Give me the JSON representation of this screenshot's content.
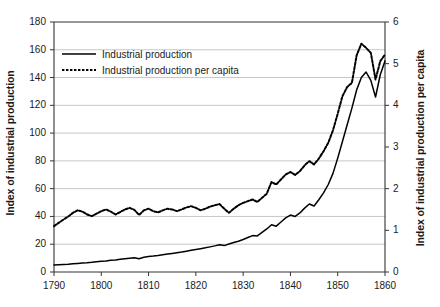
{
  "chart_data": {
    "type": "line",
    "title": "",
    "xlabel": "",
    "ylabel": "Index of industrial production",
    "y2label": "Index of industrial production per capita",
    "xlim": [
      1790,
      1860
    ],
    "ylim": [
      0,
      180
    ],
    "y2lim": [
      0,
      6
    ],
    "xticks": [
      "1790",
      "1800",
      "1810",
      "1820",
      "1830",
      "1840",
      "1850",
      "1860"
    ],
    "yticks": [
      "0",
      "20",
      "40",
      "60",
      "80",
      "100",
      "120",
      "140",
      "160",
      "180"
    ],
    "y2ticks": [
      "0",
      "1",
      "2",
      "3",
      "4",
      "5",
      "6"
    ],
    "grid": "horizontal",
    "legend_position": "upper-left-inside",
    "legend": [
      {
        "label": "Industrial production",
        "style": "solid",
        "axis": "left",
        "color": "#000000"
      },
      {
        "label": "Industrial production per capita",
        "style": "dotted",
        "axis": "right",
        "color": "#000000"
      }
    ],
    "x": [
      1790,
      1791,
      1792,
      1793,
      1794,
      1795,
      1796,
      1797,
      1798,
      1799,
      1800,
      1801,
      1802,
      1803,
      1804,
      1805,
      1806,
      1807,
      1808,
      1809,
      1810,
      1811,
      1812,
      1813,
      1814,
      1815,
      1816,
      1817,
      1818,
      1819,
      1820,
      1821,
      1822,
      1823,
      1824,
      1825,
      1826,
      1827,
      1828,
      1829,
      1830,
      1831,
      1832,
      1833,
      1834,
      1835,
      1836,
      1837,
      1838,
      1839,
      1840,
      1841,
      1842,
      1843,
      1844,
      1845,
      1846,
      1847,
      1848,
      1849,
      1850,
      1851,
      1852,
      1853,
      1854,
      1855,
      1856,
      1857,
      1858,
      1859,
      1860
    ],
    "series": [
      {
        "name": "Industrial production",
        "axis": "left",
        "style": "solid",
        "values": [
          5.0,
          5.2,
          5.4,
          5.6,
          5.9,
          6.2,
          6.5,
          6.7,
          7.0,
          7.4,
          7.7,
          8.0,
          8.4,
          8.7,
          9.1,
          9.5,
          9.9,
          10.2,
          9.6,
          10.6,
          11.2,
          11.5,
          11.9,
          12.4,
          12.9,
          13.4,
          13.9,
          14.4,
          15.0,
          15.6,
          16.2,
          16.8,
          17.4,
          18.1,
          18.8,
          19.6,
          19.0,
          20.2,
          21.2,
          22.2,
          23.4,
          24.8,
          26.2,
          26.0,
          28.5,
          31.0,
          34.0,
          33.0,
          36.0,
          39.0,
          41.0,
          40.0,
          42.5,
          46.0,
          49.0,
          47.5,
          52.0,
          57.0,
          63.0,
          71.0,
          82.0,
          94.0,
          106.0,
          118.0,
          131.0,
          140.0,
          144.0,
          138.0,
          126.0,
          142.0,
          152.0
        ]
      },
      {
        "name": "Industrial production per capita",
        "axis": "right",
        "style": "dotted",
        "values": [
          1.1,
          1.18,
          1.26,
          1.33,
          1.42,
          1.48,
          1.45,
          1.38,
          1.34,
          1.4,
          1.46,
          1.5,
          1.45,
          1.38,
          1.44,
          1.5,
          1.54,
          1.49,
          1.37,
          1.48,
          1.52,
          1.46,
          1.43,
          1.48,
          1.52,
          1.5,
          1.46,
          1.5,
          1.55,
          1.58,
          1.54,
          1.48,
          1.52,
          1.57,
          1.6,
          1.63,
          1.52,
          1.42,
          1.52,
          1.6,
          1.66,
          1.7,
          1.74,
          1.68,
          1.78,
          1.88,
          2.16,
          2.1,
          2.22,
          2.34,
          2.4,
          2.33,
          2.42,
          2.56,
          2.66,
          2.58,
          2.72,
          2.9,
          3.1,
          3.4,
          3.8,
          4.22,
          4.44,
          4.54,
          5.2,
          5.48,
          5.38,
          5.26,
          4.62,
          5.06,
          5.22
        ]
      }
    ]
  },
  "axes": {
    "left_title": "Index of industrial production",
    "right_title": "Index of industrial production per capita"
  },
  "legend": {
    "items": [
      {
        "label": "Industrial production"
      },
      {
        "label": "Industrial production per capita"
      }
    ]
  }
}
